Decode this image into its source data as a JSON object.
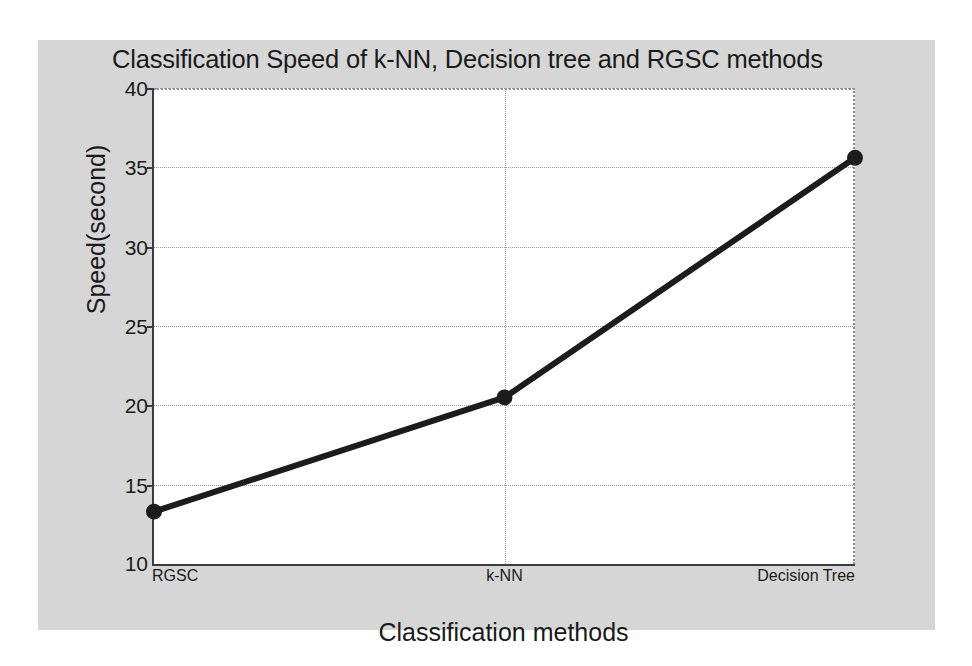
{
  "chart_data": {
    "type": "line",
    "title": "Classification Speed of k-NN, Decision tree and RGSC methods",
    "xlabel": "Classification methods",
    "ylabel": "Speed(second)",
    "categories": [
      "RGSC",
      "k-NN",
      "Decision Tree"
    ],
    "values": [
      13.3,
      20.5,
      35.6
    ],
    "series": [
      {
        "name": "Classification Speed",
        "values": [
          13.3,
          20.5,
          35.6
        ]
      }
    ],
    "ylim": [
      10,
      40
    ],
    "yticks": [
      10,
      15,
      20,
      25,
      30,
      35,
      40
    ],
    "ytick_labels": [
      "10",
      "15",
      "20",
      "25",
      "30",
      "35",
      "40"
    ],
    "xtick_labels": [
      "RGSC",
      "k-NN",
      "Decision Tree"
    ],
    "grid": true,
    "legend": null,
    "line_color": "#1c1c1c",
    "marker": "circle",
    "figure_background": "#d6d6d6",
    "plot_background": "#ffffff"
  }
}
